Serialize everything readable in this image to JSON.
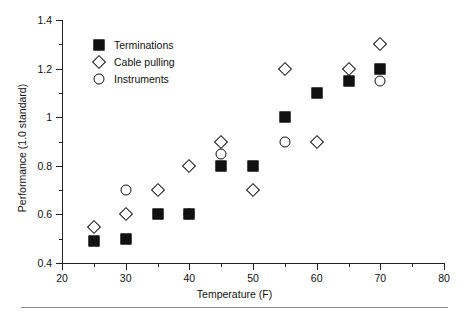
{
  "chart_data": {
    "type": "scatter",
    "title": "",
    "xlabel": "Temperature (F)",
    "ylabel": "Performance (1.0 standard)",
    "xlim": [
      20,
      80
    ],
    "ylim": [
      0.4,
      1.4
    ],
    "x_ticks": [
      20,
      30,
      40,
      50,
      60,
      70,
      80
    ],
    "x_tick_labels": [
      "20",
      "30",
      "40",
      "50",
      "60",
      "70",
      "80"
    ],
    "x_minor_ticks": [
      25,
      35,
      45,
      55,
      65,
      75
    ],
    "y_ticks": [
      0.4,
      0.6,
      0.8,
      1.0,
      1.2,
      1.4
    ],
    "y_tick_labels": [
      "0.4",
      "0.6",
      "0.8",
      "1",
      "1.2",
      "1.4"
    ],
    "y_minor_ticks": [
      0.5,
      0.7,
      0.9,
      1.1,
      1.3
    ],
    "grid": false,
    "legend_position": "upper-left",
    "series": [
      {
        "name": "Terminations",
        "marker": "filled-square",
        "color": "#111111",
        "points": [
          {
            "x": 25,
            "y": 0.49
          },
          {
            "x": 30,
            "y": 0.5
          },
          {
            "x": 35,
            "y": 0.6
          },
          {
            "x": 40,
            "y": 0.6
          },
          {
            "x": 45,
            "y": 0.8
          },
          {
            "x": 50,
            "y": 0.8
          },
          {
            "x": 55,
            "y": 1.0
          },
          {
            "x": 60,
            "y": 1.1
          },
          {
            "x": 65,
            "y": 1.15
          },
          {
            "x": 70,
            "y": 1.2
          }
        ]
      },
      {
        "name": "Cable pulling",
        "marker": "open-diamond",
        "color": "#111111",
        "points": [
          {
            "x": 25,
            "y": 0.55
          },
          {
            "x": 30,
            "y": 0.6
          },
          {
            "x": 35,
            "y": 0.7
          },
          {
            "x": 40,
            "y": 0.8
          },
          {
            "x": 45,
            "y": 0.9
          },
          {
            "x": 50,
            "y": 0.7
          },
          {
            "x": 55,
            "y": 1.2
          },
          {
            "x": 60,
            "y": 0.9
          },
          {
            "x": 65,
            "y": 1.2
          },
          {
            "x": 70,
            "y": 1.3
          }
        ]
      },
      {
        "name": "Instruments",
        "marker": "open-circle",
        "color": "#111111",
        "points": [
          {
            "x": 30,
            "y": 0.7
          },
          {
            "x": 40,
            "y": 0.6
          },
          {
            "x": 45,
            "y": 0.85
          },
          {
            "x": 55,
            "y": 0.9
          },
          {
            "x": 70,
            "y": 1.15
          }
        ]
      }
    ]
  },
  "legend": {
    "entries": [
      {
        "label": "Terminations",
        "marker": "filled-square"
      },
      {
        "label": "Cable pulling",
        "marker": "open-diamond"
      },
      {
        "label": "Instruments",
        "marker": "open-circle"
      }
    ]
  }
}
